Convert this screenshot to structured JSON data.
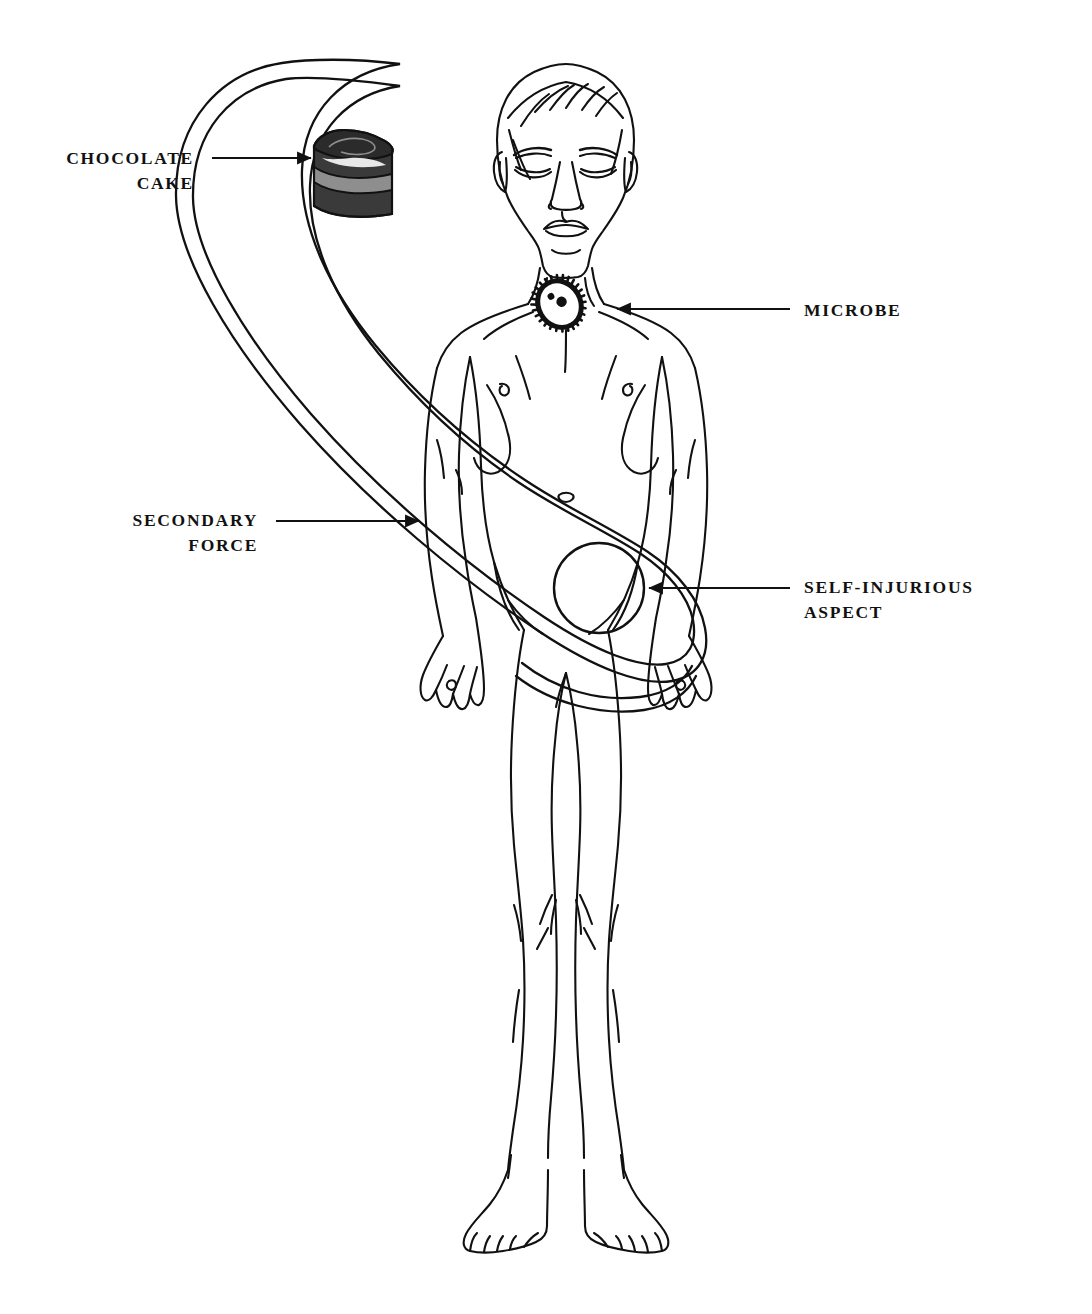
{
  "diagram": {
    "background_color": "#ffffff",
    "ink_color": "#111111",
    "labels": [
      {
        "id": "chocolate-cake",
        "line1": "CHOCOLATE",
        "line2": "CAKE",
        "align": "right",
        "x": 194,
        "y": 146,
        "arrow": {
          "from_x": 212,
          "from_y": 158,
          "to_x": 318,
          "to_y": 158,
          "direction": "right"
        }
      },
      {
        "id": "microbe",
        "line1": "MICROBE",
        "line2": "",
        "align": "left",
        "x": 804,
        "y": 298,
        "arrow": {
          "from_x": 790,
          "from_y": 309,
          "to_x": 612,
          "to_y": 309,
          "direction": "left"
        }
      },
      {
        "id": "secondary-force",
        "line1": "SECONDARY",
        "line2": "FORCE",
        "align": "right",
        "x": 258,
        "y": 508,
        "arrow": {
          "from_x": 276,
          "from_y": 521,
          "to_x": 424,
          "to_y": 521,
          "direction": "right"
        }
      },
      {
        "id": "self-injurious-aspect",
        "line1": "SELF-INJURIOUS",
        "line2": "ASPECT",
        "align": "left",
        "x": 804,
        "y": 575,
        "arrow": {
          "from_x": 790,
          "from_y": 588,
          "to_x": 644,
          "to_y": 588,
          "direction": "left"
        }
      }
    ],
    "elements": {
      "cake": {
        "name": "chocolate-cake-slice",
        "frosting_color": "#2b2b2b",
        "dark_layer_color": "#3a3a3a",
        "light_layer_color": "#8e8e8e",
        "outline_color": "#111111"
      },
      "microbe": {
        "name": "spiky-microbe-cell",
        "fill_color": "#111111",
        "spikes": 28,
        "nucleus_dots": 2
      },
      "loop": {
        "name": "double-line-loop",
        "stroke_color": "#111111",
        "stroke_width": 2.2,
        "description": "elongated closed double-stroke loop from upper-left to lower abdomen"
      },
      "abdomen_circle": {
        "name": "abdomen-circle",
        "center_x": 599,
        "center_y": 588,
        "radius": 45
      }
    }
  }
}
